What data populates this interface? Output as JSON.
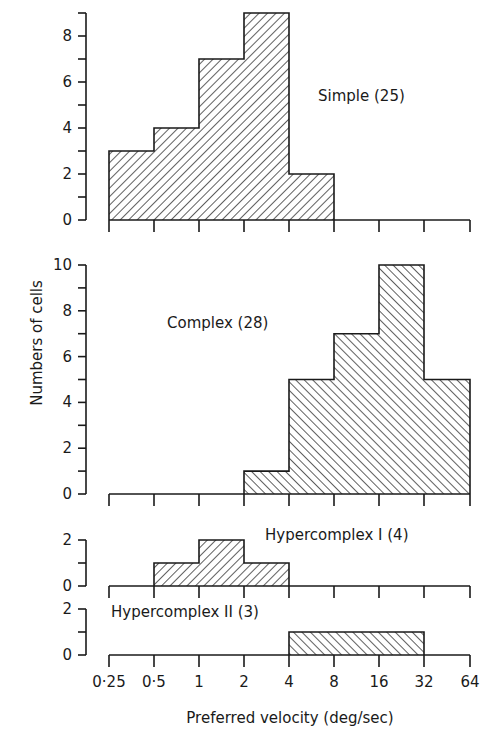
{
  "chart_data": {
    "type": "bar",
    "title": "",
    "xlabel": "Preferred velocity  (deg/sec)",
    "ylabel": "Numbers of cells",
    "x_scale": "log2",
    "bin_edges": [
      0.25,
      0.5,
      1,
      2,
      4,
      8,
      16,
      32,
      64
    ],
    "x_tick_labels": [
      "0·25",
      "0·5",
      "1",
      "2",
      "4",
      "8",
      "16",
      "32",
      "64"
    ],
    "categories": [
      "0.25–0.5",
      "0.5–1",
      "1–2",
      "2–4",
      "4–8",
      "8–16",
      "16–32",
      "32–64"
    ],
    "grid": false,
    "series": [
      {
        "name": "Simple (25)",
        "values": [
          3,
          4,
          7,
          9,
          2,
          0,
          0,
          0
        ],
        "hatch": "forward",
        "ylim": [
          0,
          9
        ],
        "y_ticks": [
          "0",
          "2",
          "4",
          "6",
          "8"
        ]
      },
      {
        "name": "Complex (28)",
        "values": [
          0,
          0,
          0,
          1,
          5,
          7,
          10,
          5
        ],
        "hatch": "backward",
        "ylim": [
          0,
          10
        ],
        "y_ticks": [
          "0",
          "2",
          "4",
          "6",
          "8",
          "10"
        ]
      },
      {
        "name": "Hypercomplex I (4)",
        "values": [
          0,
          1,
          2,
          1,
          0,
          0,
          0,
          0
        ],
        "hatch": "forward",
        "ylim": [
          0,
          2
        ],
        "y_ticks": [
          "0",
          "2"
        ]
      },
      {
        "name": "Hypercomplex II (3)",
        "values": [
          0,
          0,
          0,
          0,
          1,
          1,
          1,
          0
        ],
        "hatch": "backward",
        "ylim": [
          0,
          2
        ],
        "y_ticks": [
          "0",
          "2"
        ]
      }
    ]
  },
  "panels": [
    {
      "label": "Simple (25)"
    },
    {
      "label": "Complex (28)"
    },
    {
      "label": "Hypercomplex I (4)"
    },
    {
      "label": "Hypercomplex II (3)"
    }
  ],
  "axes": {
    "xlabel": "Preferred velocity  (deg/sec)",
    "ylabel": "Numbers of cells"
  }
}
